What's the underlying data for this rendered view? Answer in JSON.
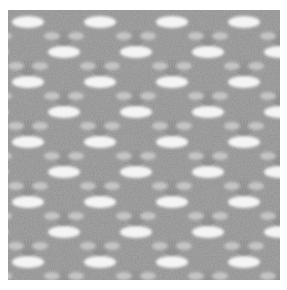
{
  "image": {
    "subject": "crochet lace fabric swatch",
    "description": "Close-up photograph of a grey crochet lace swatch with alternating rows of shell/fan stitch clusters and white oval openings",
    "colors": {
      "background": "#ffffff",
      "fabric": "#a6a6a6",
      "fabric_dark": "#8a8a8a",
      "fabric_light": "#c4c4c4",
      "holes": "#f4f4f4"
    }
  }
}
